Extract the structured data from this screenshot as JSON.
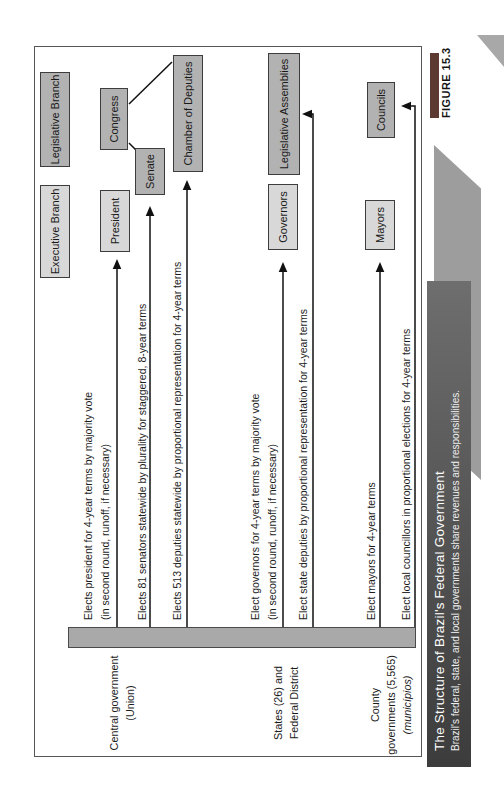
{
  "figure": {
    "label": "FIGURE 15.3",
    "title": "The Structure of Brazil's Federal Government",
    "subtitle": "Brazil's federal, state, and local governments share revenues and responsibilities."
  },
  "headers": {
    "executive": "Executive Branch",
    "legislative": "Legislative Branch"
  },
  "rows": [
    {
      "label_lines": [
        "Central government",
        "(Union)"
      ]
    },
    {
      "label_lines": [
        "States (26) and",
        "Federal District"
      ]
    },
    {
      "label_lines": [
        "County",
        "governments (5,565)",
        "(municípios)"
      ]
    }
  ],
  "nodes": {
    "president": "President",
    "senate": "Senate",
    "congress": "Congress",
    "chamber": "Chamber of Deputies",
    "governors": "Governors",
    "assemblies": "Legislative Assemblies",
    "mayors": "Mayors",
    "councils": "Councils"
  },
  "arrows": [
    {
      "to": "president",
      "line1": "Elects president for 4-year terms by majority vote",
      "line2": "(in second round, runoff, if necessary)"
    },
    {
      "to": "senate",
      "line1": "Elects 81 senators statewide by plurality for staggered, 8-year terms"
    },
    {
      "to": "chamber",
      "line1": "Elects 513 deputies statewide by proportional representation for 4-year terms"
    },
    {
      "to": "governors",
      "line1": "Elect governors for 4-year terms by majority vote",
      "line2": "(in second round, runoff, if necessary)"
    },
    {
      "to": "assemblies",
      "line1": "Elect state deputies by proportional representation for 4-year terms"
    },
    {
      "to": "mayors",
      "line1": "Elect mayors for 4-year terms"
    },
    {
      "to": "councils",
      "line1": "Elect local councillors in proportional elections for 4-year terms"
    }
  ],
  "colors": {
    "light_box": "#d8d8d8",
    "dark_box": "#b2b2b2",
    "box_border": "#3d3d3d",
    "spine": "#a9a9a9",
    "titlebar_left": "#3c3c3c",
    "titlebar_right": "#6e6e6e",
    "figure_tab": "#5c3a31",
    "decorative_band": "#9d9d9d",
    "arrow": "#111111"
  },
  "orientation_note": "figure printed rotated 90° counterclockwise on page"
}
